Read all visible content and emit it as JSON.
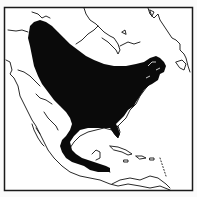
{
  "map": {
    "type": "species-range-map",
    "region": "North America",
    "colors": {
      "background": "#fbfbfb",
      "land_outline": "#111111",
      "range_fill": "#0a0a0a",
      "frame": "#1a1a1a"
    },
    "layers": [
      "frame",
      "coastlines",
      "range"
    ]
  }
}
